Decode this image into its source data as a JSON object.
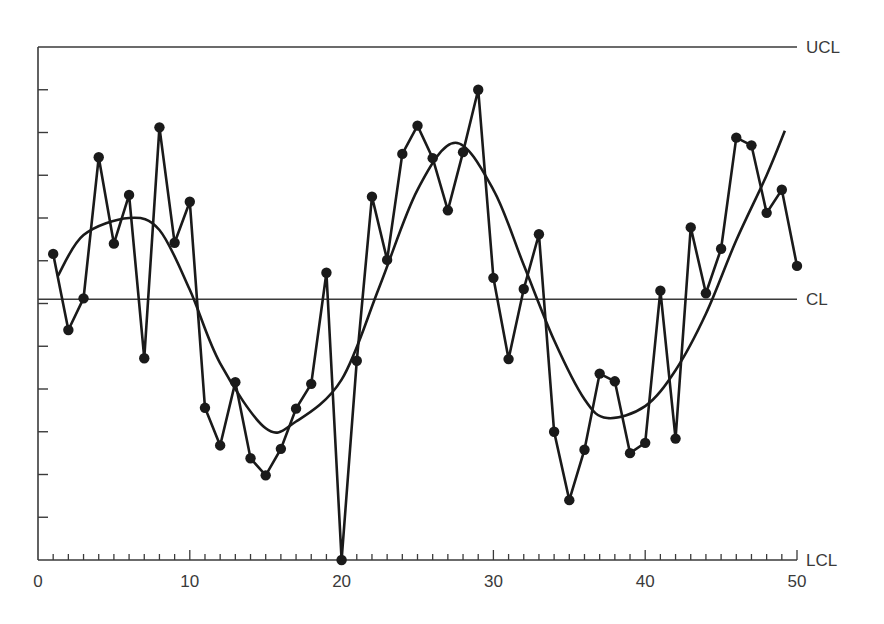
{
  "chart_data": {
    "type": "line",
    "title": "",
    "xlabel": "",
    "ylabel": "",
    "x_ticks": [
      0,
      10,
      20,
      30,
      40,
      50
    ],
    "x_tick_labels": [
      "0",
      "10",
      "20",
      "30",
      "40",
      "50"
    ],
    "xlim": [
      0,
      50
    ],
    "ylim": [
      -3,
      3
    ],
    "y_tick_step": 0.5,
    "y_tick_labels": [],
    "grid": false,
    "control_lines": [
      {
        "name": "UCL",
        "label": "UCL",
        "value": 3.0
      },
      {
        "name": "CL",
        "label": "CL",
        "value": 0.05
      },
      {
        "name": "LCL",
        "label": "LCL",
        "value": -3.0
      }
    ],
    "series": [
      {
        "name": "observations",
        "style": "line-with-markers",
        "x": [
          1,
          2,
          3,
          4,
          5,
          6,
          7,
          8,
          9,
          10,
          11,
          12,
          13,
          14,
          15,
          16,
          17,
          18,
          19,
          20,
          21,
          22,
          23,
          24,
          25,
          26,
          27,
          28,
          29,
          30,
          31,
          32,
          33,
          34,
          35,
          36,
          37,
          38,
          39,
          40,
          41,
          42,
          43,
          44,
          45,
          46,
          47,
          48,
          49,
          50
        ],
        "values": [
          0.58,
          -0.31,
          0.06,
          1.71,
          0.7,
          1.27,
          -0.64,
          2.06,
          0.71,
          1.19,
          -1.22,
          -1.66,
          -0.92,
          -1.81,
          -2.01,
          -1.7,
          -1.23,
          -0.94,
          0.36,
          -3.0,
          -0.67,
          1.25,
          0.51,
          1.75,
          2.08,
          1.7,
          1.09,
          1.77,
          2.5,
          0.3,
          -0.65,
          0.17,
          0.81,
          -1.5,
          -2.3,
          -1.71,
          -0.82,
          -0.91,
          -1.75,
          -1.63,
          0.15,
          -1.58,
          0.89,
          0.12,
          0.64,
          1.94,
          1.85,
          1.06,
          1.33,
          0.44
        ]
      },
      {
        "name": "smoothed-trend",
        "style": "smooth-line",
        "x": [
          1.3,
          3,
          6,
          8,
          10,
          12,
          15,
          17,
          20,
          22.5,
          25,
          27.5,
          30,
          32,
          34,
          36,
          37.5,
          40,
          42,
          44,
          46,
          48,
          49.2
        ],
        "values": [
          0.32,
          0.8,
          1.0,
          0.86,
          0.16,
          -0.7,
          -1.46,
          -1.38,
          -0.89,
          0.2,
          1.33,
          1.88,
          1.33,
          0.45,
          -0.43,
          -1.12,
          -1.34,
          -1.2,
          -0.78,
          -0.12,
          0.74,
          1.5,
          2.02
        ]
      }
    ]
  }
}
